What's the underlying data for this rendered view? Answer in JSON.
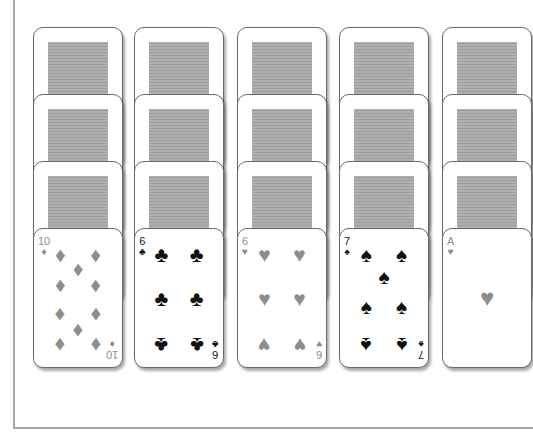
{
  "game": "Solitaire tableau",
  "colors": {
    "red_suit": "#8d8d8d",
    "black_suit": "#111111",
    "card_border": "#6a6a6a",
    "card_back": "#a9a9a9",
    "table_border": "#a8a8a8"
  },
  "columns": [
    {
      "face_down": 3,
      "top": {
        "rank": "10",
        "suit": "diamonds",
        "glyph": "♦",
        "color": "red"
      }
    },
    {
      "face_down": 3,
      "top": {
        "rank": "6",
        "suit": "clubs",
        "glyph": "♣",
        "color": "black"
      }
    },
    {
      "face_down": 3,
      "top": {
        "rank": "6",
        "suit": "hearts",
        "glyph": "♥",
        "color": "red"
      }
    },
    {
      "face_down": 3,
      "top": {
        "rank": "7",
        "suit": "spades",
        "glyph": "♠",
        "color": "black"
      }
    },
    {
      "face_down": 3,
      "top": {
        "rank": "A",
        "suit": "hearts",
        "glyph": "♥",
        "color": "red"
      }
    }
  ]
}
